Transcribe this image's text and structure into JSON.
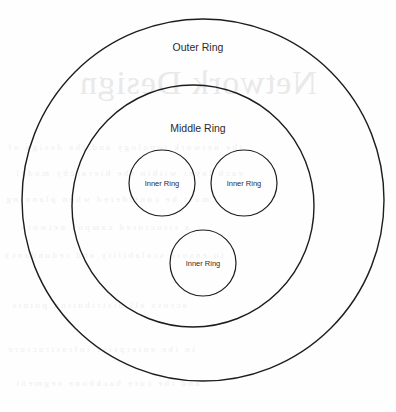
{
  "page": {
    "width": 396,
    "height": 412,
    "background_color": "#fefefe",
    "ink_color": "#1d1d1f"
  },
  "diagram": {
    "type": "concentric-circles",
    "title_label": "Outer Ring",
    "rings": [
      {
        "id": "outer-ring",
        "label": "Outer Ring",
        "level": 1,
        "cx": 203,
        "cy": 200,
        "r": 181,
        "stroke_width": 1.4
      },
      {
        "id": "middle-ring",
        "label": "Middle Ring",
        "level": 2,
        "cx": 193,
        "cy": 206,
        "r": 121,
        "stroke_width": 1.4
      }
    ],
    "inner_circles": [
      {
        "id": "inner-ring-left",
        "label": "Inner Ring",
        "cx": 162,
        "cy": 183,
        "r": 33,
        "stroke_width": 1.2
      },
      {
        "id": "inner-ring-right",
        "label": "Inner Ring",
        "cx": 244,
        "cy": 183,
        "r": 33,
        "stroke_width": 1.2
      },
      {
        "id": "inner-ring-bottom",
        "label": "Inner Ring",
        "cx": 203,
        "cy": 263,
        "r": 33,
        "stroke_width": 1.2
      }
    ]
  },
  "scan_artifacts": {
    "description": "faint mirrored bleed-through from reverse side of page",
    "ghost_title": "Network Design",
    "ghost_color": "#e9e9ea",
    "ghost_lines": [
      "the network topology and the design of",
      "each layer within the hierarchy model",
      "must be considered when planning",
      "a structured campus network",
      "to ensure scalability and redundancy",
      "across all distribution points",
      "in the enterprise infrastructure",
      "and the core backbone segment"
    ]
  }
}
